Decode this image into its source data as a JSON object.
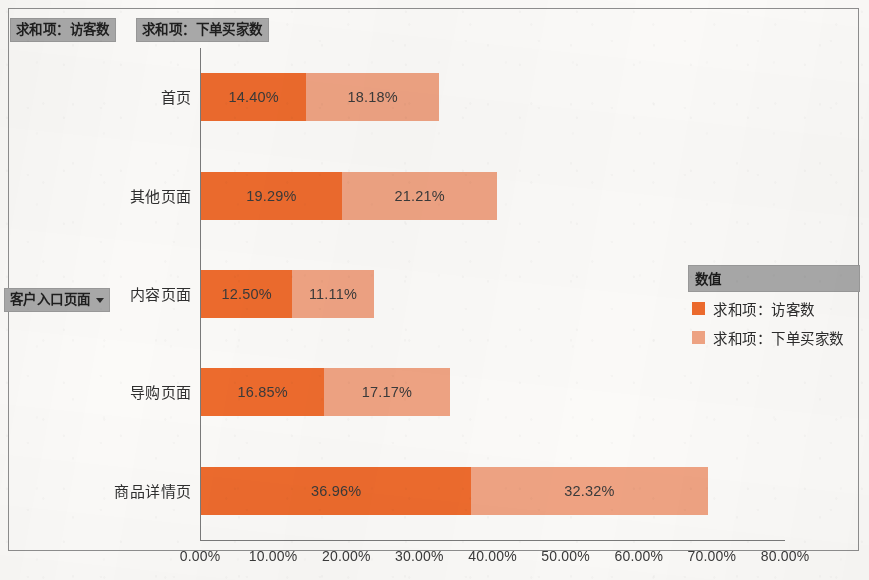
{
  "field_buttons": {
    "series_a": "求和项：访客数",
    "series_b": "求和项：下单买家数",
    "axis_field": "客户入口页面"
  },
  "legend": {
    "title": "数值",
    "items": [
      {
        "label": "求和项：访客数",
        "color": "#ed6b2d"
      },
      {
        "label": "求和项：下单买家数",
        "color": "#efa383"
      }
    ]
  },
  "chart_data": {
    "type": "bar",
    "orientation": "horizontal",
    "stacked": true,
    "title": "",
    "xlabel": "",
    "ylabel": "客户入口页面",
    "xlim": [
      0,
      80
    ],
    "grid": false,
    "legend_position": "right",
    "categories": [
      "首页",
      "其他页面",
      "内容页面",
      "导购页面",
      "商品详情页"
    ],
    "tick_labels": [
      "0.00%",
      "10.00%",
      "20.00%",
      "30.00%",
      "40.00%",
      "50.00%",
      "60.00%",
      "70.00%",
      "80.00%"
    ],
    "tick_values": [
      0,
      10,
      20,
      30,
      40,
      50,
      60,
      70,
      80
    ],
    "series": [
      {
        "name": "求和项：访客数",
        "color": "#ed6b2d",
        "values": [
          14.4,
          19.29,
          12.5,
          16.85,
          36.96
        ],
        "labels": [
          "14.40%",
          "19.29%",
          "12.50%",
          "16.85%",
          "36.96%"
        ]
      },
      {
        "name": "求和项：下单买家数",
        "color": "#efa383",
        "values": [
          18.18,
          21.21,
          11.11,
          17.17,
          32.32
        ],
        "labels": [
          "18.18%",
          "21.21%",
          "11.11%",
          "17.17%",
          "32.32%"
        ]
      }
    ]
  }
}
